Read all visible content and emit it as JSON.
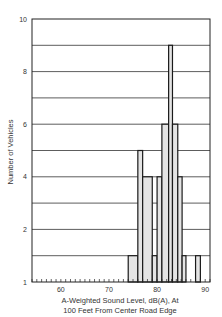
{
  "chart_data": {
    "type": "bar",
    "subtype": "histogram",
    "title": "",
    "xlabel": "A-Weighted Sound Level, dB(A), At 100 Feet From Center Road Edge",
    "xlabel_lines": [
      "A-Weighted Sound Level, dB(A), At",
      "100 Feet From Center Road Edge"
    ],
    "ylabel": "Number of Vehicles",
    "xlim": [
      54,
      91
    ],
    "ylim": [
      0,
      10
    ],
    "x_ticks": [
      60,
      70,
      80,
      90
    ],
    "y_ticks": [
      {
        "value": 10,
        "label": "10"
      },
      {
        "value": 8,
        "label": "8"
      },
      {
        "value": 6,
        "label": "6"
      },
      {
        "value": 4,
        "label": "4"
      },
      {
        "value": 2,
        "label": "2"
      },
      {
        "value": 0,
        "label": "1"
      }
    ],
    "grid": {
      "horizontal": true,
      "vertical": false,
      "y_step": 1
    },
    "legend": null,
    "bins": [
      {
        "from": 74,
        "to": 76,
        "count": 1
      },
      {
        "from": 76,
        "to": 77,
        "count": 5
      },
      {
        "from": 77,
        "to": 79,
        "count": 4
      },
      {
        "from": 79,
        "to": 80,
        "count": 1
      },
      {
        "from": 80,
        "to": 81,
        "count": 4
      },
      {
        "from": 81,
        "to": 82.4,
        "count": 6
      },
      {
        "from": 82.4,
        "to": 83.2,
        "count": 9
      },
      {
        "from": 83.2,
        "to": 84.3,
        "count": 6
      },
      {
        "from": 84.3,
        "to": 85.2,
        "count": 4
      },
      {
        "from": 85.2,
        "to": 86,
        "count": 1
      },
      {
        "from": 88,
        "to": 89,
        "count": 1
      }
    ],
    "categories": [
      "74-76",
      "76-77",
      "77-79",
      "79-80",
      "80-81",
      "81-82",
      "82-83",
      "83-84",
      "84-85",
      "85-86",
      "88-89"
    ],
    "values": [
      1,
      5,
      4,
      1,
      4,
      6,
      9,
      6,
      4,
      1,
      1
    ]
  },
  "colors": {
    "bar_fill": "#e4e4e4",
    "bar_stroke": "#1a1a1a",
    "grid": "#333333",
    "axis": "#222222"
  }
}
